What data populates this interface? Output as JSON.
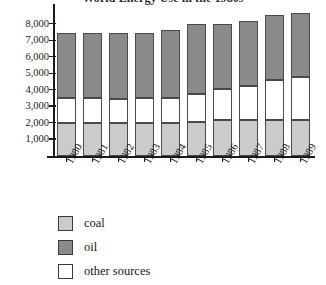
{
  "chart_data": {
    "type": "bar",
    "title": "World Energy Use in the 1980s",
    "xlabel": "",
    "ylabel": "",
    "ylim": [
      0,
      9000
    ],
    "grid": false,
    "stacked": true,
    "legend_position": "bottom-left",
    "categories": [
      "1980",
      "1981",
      "1982",
      "1983",
      "1984",
      "1985",
      "1986",
      "1987",
      "1988",
      "1989"
    ],
    "ytick_labels": [
      "1,000",
      "2,000",
      "3,000",
      "4,000",
      "5,000",
      "6,000",
      "7,000",
      "8,000"
    ],
    "ytick_values": [
      1000,
      2000,
      3000,
      4000,
      5000,
      6000,
      7000,
      8000
    ],
    "series": [
      {
        "name": "coal",
        "color": "#cbcbcb",
        "values": [
          2000,
          2000,
          2000,
          2000,
          2000,
          2050,
          2200,
          2200,
          2200,
          2200
        ]
      },
      {
        "name": "other sources",
        "color": "#ffffff",
        "values": [
          1500,
          1500,
          1450,
          1500,
          1500,
          1750,
          1900,
          2050,
          2450,
          2600
        ]
      },
      {
        "name": "oil",
        "color": "#8a8a8a",
        "values": [
          4000,
          4000,
          4050,
          4000,
          4150,
          4200,
          3900,
          3950,
          3950,
          3900
        ]
      }
    ],
    "totals": [
      7500,
      7500,
      7500,
      7500,
      7650,
      8000,
      8000,
      8200,
      8600,
      8700
    ]
  },
  "legend": {
    "items": [
      {
        "label": "coal"
      },
      {
        "label": "oil"
      },
      {
        "label": "other sources"
      }
    ]
  }
}
